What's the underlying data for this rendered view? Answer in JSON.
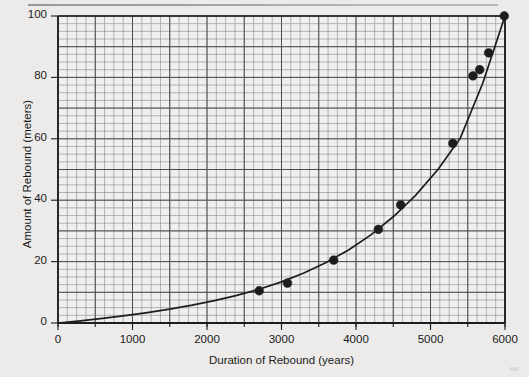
{
  "page": {
    "background_color": "#eeedeb",
    "header_fragment": "",
    "corner_mark": ""
  },
  "chart_data": {
    "type": "scatter",
    "title": "",
    "xlabel": "Duration of Rebound (years)",
    "ylabel": "Amount of Rebound (meters)",
    "xlim": [
      0,
      6000
    ],
    "ylim": [
      0,
      100
    ],
    "xticks": [
      0,
      1000,
      2000,
      3000,
      4000,
      5000,
      6000
    ],
    "yticks": [
      0,
      20,
      40,
      60,
      80,
      100
    ],
    "xtick_labels": [
      "0",
      "1000",
      "2000",
      "3000",
      "4000",
      "5000",
      "6000"
    ],
    "ytick_labels": [
      "0",
      "20",
      "40",
      "60",
      "80",
      "100"
    ],
    "grid": true,
    "grid_minor_x_step": 125,
    "grid_major_x_step": 500,
    "grid_minor_y_step": 2.5,
    "grid_major_y_step": 10,
    "legend": null,
    "marker_color": "#1d1d1d",
    "curve_color": "#1d1d1d",
    "axis_color": "#1d1d1d",
    "grid_color": "#6e6e6e",
    "series": [
      {
        "name": "Observed rebound",
        "kind": "scatter",
        "x": [
          2700,
          3080,
          3700,
          4300,
          4600,
          5300,
          5570,
          5660,
          5780,
          5990
        ],
        "y": [
          10.5,
          13.0,
          20.5,
          30.5,
          38.5,
          58.5,
          80.5,
          82.5,
          88.0,
          100.0
        ]
      },
      {
        "name": "Fitted rebound curve",
        "kind": "line",
        "x": [
          0,
          300,
          600,
          900,
          1200,
          1500,
          1800,
          2100,
          2400,
          2700,
          3000,
          3300,
          3600,
          3900,
          4200,
          4500,
          4800,
          5100,
          5400,
          5700,
          6000
        ],
        "y": [
          0.0,
          0.7,
          1.5,
          2.4,
          3.4,
          4.5,
          5.8,
          7.3,
          9.0,
          11.0,
          13.4,
          16.3,
          19.7,
          23.8,
          28.7,
          34.6,
          41.6,
          50.0,
          60.2,
          78.0,
          100.0
        ]
      }
    ]
  }
}
